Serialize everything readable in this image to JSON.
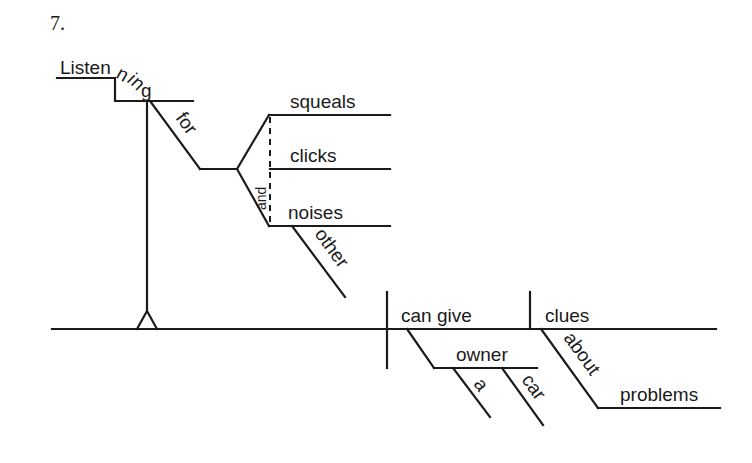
{
  "problem_number": "7.",
  "sentence_words": {
    "gerund_head": "Listen",
    "gerund_tail_n": "n",
    "gerund_tail_i": "i",
    "gerund_tail_n2": "n",
    "gerund_tail_g": "g",
    "preposition_for": "for",
    "object_1": "squeals",
    "object_2": "clicks",
    "object_3": "noises",
    "conjunction": "and",
    "modifier_other": "other",
    "verb": "can give",
    "direct_object": "clues",
    "indirect_object": "owner",
    "article_a": "a",
    "modifier_car": "car",
    "preposition_about": "about",
    "object_problems": "problems"
  }
}
